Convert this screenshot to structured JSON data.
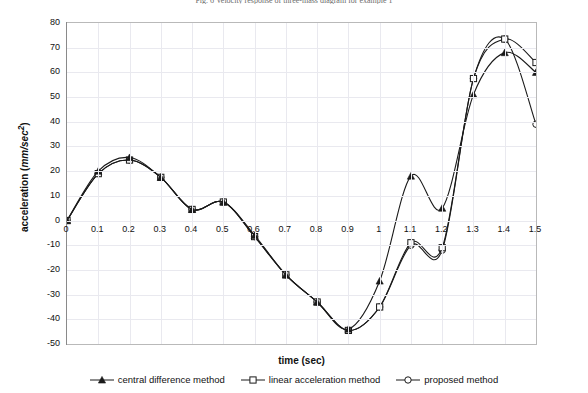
{
  "figure": {
    "title": "Fig. 6  Velocity response of three-mass diagram for example 1",
    "xtitle": "time (sec)",
    "ytitle_main": "acceleration (",
    "ytitle_unit": "mm/sec",
    "ytitle_sup": "2",
    "ytitle_close": ")"
  },
  "legend": {
    "position": "bottom",
    "items": [
      {
        "label": "central difference method",
        "marker": "triangle-up-filled",
        "symbol_name": "legend-marker-triangle"
      },
      {
        "label": "linear acceleration method",
        "marker": "square-open",
        "symbol_name": "legend-marker-square"
      },
      {
        "label": "proposed method",
        "marker": "circle-open",
        "symbol_name": "legend-marker-circle"
      }
    ]
  },
  "axes": {
    "x": {
      "label": "time (sec)",
      "min": 0,
      "max": 1.5,
      "step": 0.1,
      "ticks": [
        "0",
        "0.1",
        "0.2",
        "0.3",
        "0.4",
        "0.5",
        "0.6",
        "0.7",
        "0.8",
        "0.9",
        "1",
        "1.1",
        "1.2",
        "1.3",
        "1.4",
        "1.5"
      ]
    },
    "y": {
      "label": "acceleration (mm/sec2)",
      "min": -50,
      "max": 80,
      "step": 10,
      "ticks": [
        "80",
        "70",
        "60",
        "50",
        "40",
        "30",
        "20",
        "10",
        "0",
        "-10",
        "-20",
        "-30",
        "-40",
        "-50"
      ]
    },
    "grid": true
  },
  "chart_data": {
    "type": "line",
    "title": "Fig. 6  Velocity response of three-mass diagram for example 1",
    "xlabel": "time (sec)",
    "ylabel": "acceleration (mm/sec2)",
    "xlim": [
      0,
      1.5
    ],
    "ylim": [
      -50,
      80
    ],
    "grid": true,
    "legend_position": "bottom",
    "x": [
      0,
      0.1,
      0.2,
      0.3,
      0.4,
      0.5,
      0.6,
      0.7,
      0.8,
      0.9,
      1.0,
      1.1,
      1.2,
      1.3,
      1.4,
      1.5
    ],
    "series": [
      {
        "name": "central difference method",
        "marker": "triangle-up-filled",
        "values": [
          0,
          20,
          25.5,
          17.5,
          4.5,
          7.5,
          -6,
          -22,
          -33,
          -44,
          -24.5,
          18,
          5,
          51,
          68,
          60
        ]
      },
      {
        "name": "linear acceleration method",
        "marker": "square-open",
        "values": [
          0,
          19,
          24.5,
          17.5,
          4.5,
          7.5,
          -6.5,
          -22,
          -33,
          -44.5,
          -35,
          -9,
          -11,
          57.5,
          73.5,
          64
        ]
      },
      {
        "name": "proposed method",
        "marker": "circle-open",
        "values": [
          0,
          19,
          24.5,
          17.5,
          4.5,
          7.5,
          -6.5,
          -22,
          -33,
          -44.5,
          -35,
          -10,
          -12,
          57.5,
          73.5,
          39
        ]
      }
    ]
  }
}
